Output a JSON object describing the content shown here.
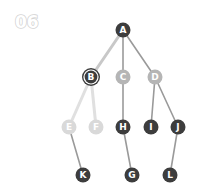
{
  "step_label": "06",
  "colors": {
    "dark_node": "#3d3d3d",
    "gray_node": "#b5b5b5",
    "light_node": "#d9d9d9",
    "dark_edge": "#9a9a9a",
    "light_edge": "#c8c8c8",
    "faint_edge": "#e0e0e0",
    "node_text": "#ffffff"
  },
  "nodes": [
    {
      "id": "A",
      "label": "A",
      "x": 123,
      "y": 30,
      "state": "dark"
    },
    {
      "id": "B",
      "label": "B",
      "x": 91,
      "y": 77,
      "state": "current"
    },
    {
      "id": "C",
      "label": "C",
      "x": 123,
      "y": 77,
      "state": "gray"
    },
    {
      "id": "D",
      "label": "D",
      "x": 155,
      "y": 77,
      "state": "gray"
    },
    {
      "id": "E",
      "label": "E",
      "x": 69,
      "y": 127,
      "state": "light"
    },
    {
      "id": "F",
      "label": "F",
      "x": 96,
      "y": 127,
      "state": "light"
    },
    {
      "id": "H",
      "label": "H",
      "x": 123,
      "y": 127,
      "state": "dark"
    },
    {
      "id": "I",
      "label": "I",
      "x": 151,
      "y": 127,
      "state": "dark"
    },
    {
      "id": "J",
      "label": "J",
      "x": 178,
      "y": 127,
      "state": "dark"
    },
    {
      "id": "K",
      "label": "K",
      "x": 83,
      "y": 175,
      "state": "dark"
    },
    {
      "id": "G",
      "label": "G",
      "x": 132,
      "y": 175,
      "state": "dark"
    },
    {
      "id": "L",
      "label": "L",
      "x": 170,
      "y": 175,
      "state": "dark"
    }
  ],
  "edges": [
    {
      "from": "A",
      "to": "B",
      "style": "light_thick"
    },
    {
      "from": "A",
      "to": "C",
      "style": "gray"
    },
    {
      "from": "A",
      "to": "D",
      "style": "gray"
    },
    {
      "from": "B",
      "to": "E",
      "style": "faint_thick"
    },
    {
      "from": "B",
      "to": "F",
      "style": "faint_thick"
    },
    {
      "from": "C",
      "to": "H",
      "style": "gray"
    },
    {
      "from": "D",
      "to": "I",
      "style": "gray"
    },
    {
      "from": "D",
      "to": "J",
      "style": "gray"
    },
    {
      "from": "E",
      "to": "K",
      "style": "gray"
    },
    {
      "from": "H",
      "to": "G",
      "style": "gray"
    },
    {
      "from": "J",
      "to": "L",
      "style": "gray"
    }
  ]
}
